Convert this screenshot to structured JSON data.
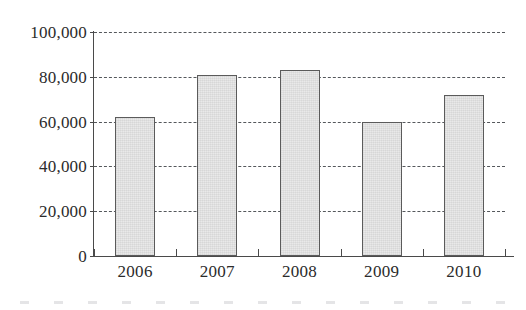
{
  "chart_data": {
    "type": "bar",
    "title": "",
    "subtitle": "",
    "xlabel": "",
    "ylabel": "",
    "categories": [
      "2006",
      "2007",
      "2008",
      "2009",
      "2010"
    ],
    "values": [
      62000,
      81000,
      83000,
      60000,
      72000
    ],
    "ylim": [
      0,
      100000
    ],
    "ytick_values": [
      0,
      20000,
      40000,
      60000,
      80000,
      100000
    ],
    "ytick_labels": [
      "0",
      "20,000",
      "40,000",
      "60,000",
      "80,000",
      "100,000"
    ],
    "grid": true,
    "grid_style": "dashed",
    "grid_axis": "y",
    "legend": false,
    "legend_position": "none",
    "series": [
      {
        "name": "",
        "values": [
          62000,
          81000,
          83000,
          60000,
          72000
        ]
      }
    ],
    "colors": {
      "bar_fill": "#e9e9e9",
      "bar_stroke": "#5b5b5b",
      "grid": "#55585c",
      "axis": "#4a4a4a",
      "text": "#2b2b2b",
      "background": "#ffffff"
    }
  }
}
